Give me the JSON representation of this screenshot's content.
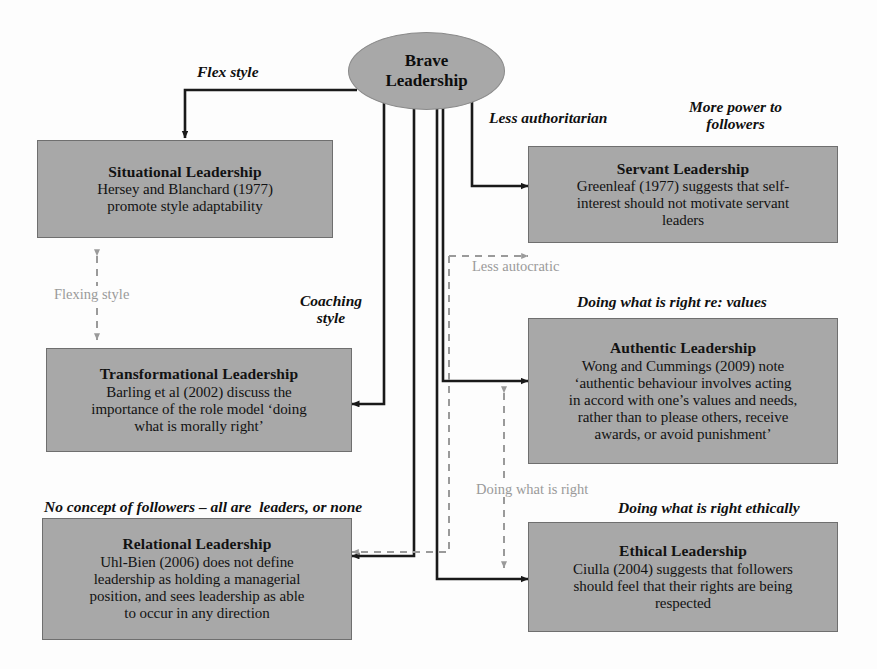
{
  "diagram": {
    "canvas": {
      "width": 877,
      "height": 669
    },
    "colors": {
      "node_fill": "#a8a8a8",
      "node_border": "#6f6f6f",
      "text": "#121212",
      "solid_edge": "#1a1a1a",
      "dashed_edge": "#9a9a9a",
      "background": "#fdfdfd"
    },
    "root": {
      "label": "Brave\nLeadership",
      "line1": "Brave",
      "line2": "Leadership"
    },
    "nodes": [
      {
        "id": "situational",
        "title": "Situational Leadership",
        "body": "Hersey and Blanchard (1977)\npromote style adaptability"
      },
      {
        "id": "servant",
        "title": "Servant Leadership",
        "body": "Greenleaf (1977) suggests that self-\ninterest should not motivate servant\nleaders"
      },
      {
        "id": "transformational",
        "title": "Transformational Leadership",
        "body": "Barling et al (2002) discuss the\nimportance of the role model ‘doing\nwhat is morally right’"
      },
      {
        "id": "authentic",
        "title": "Authentic Leadership",
        "body": "Wong and Cummings (2009) note\n‘authentic behaviour involves acting\nin accord with one’s values and needs,\nrather than to please others, receive\nawards, or avoid punishment’"
      },
      {
        "id": "relational",
        "title": "Relational Leadership",
        "body": "Uhl-Bien (2006) does not define\nleadership as holding a managerial\nposition, and sees leadership as able\nto occur in any direction"
      },
      {
        "id": "ethical",
        "title": "Ethical Leadership",
        "body": "Ciulla (2004) suggests that followers\nshould feel that their rights are being\nrespected"
      }
    ],
    "edge_labels": {
      "flex_style": "Flex style",
      "less_authoritarian": "Less authoritarian",
      "more_power_to_followers": "More power to\nfollowers",
      "less_autocratic": "Less autocratic",
      "flexing_style": "Flexing style",
      "coaching_style": "Coaching\nstyle",
      "doing_what_is_right_re_values": "Doing what is right re: values",
      "no_concept_of_followers": "No concept of followers – all are  leaders, or none",
      "doing_what_is_right": "Doing what is right",
      "doing_what_is_right_ethically": "Doing what is right ethically"
    }
  }
}
